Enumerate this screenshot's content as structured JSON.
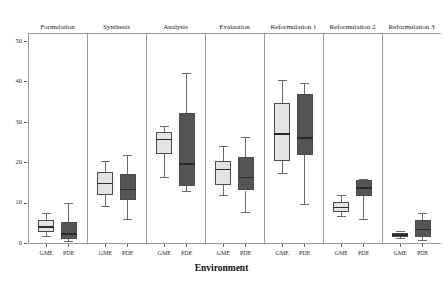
{
  "chart_data": {
    "type": "box",
    "title": "",
    "xlabel": "Environment",
    "ylabel": "",
    "ylim": [
      0,
      52
    ],
    "yticks": [
      0,
      10,
      20,
      30,
      40,
      50
    ],
    "grid": false,
    "legend": "none",
    "facet_variable": "Phase",
    "group_variable": "Environment",
    "groups": [
      "GME",
      "PDE"
    ],
    "group_colors": {
      "GME": "#e3e3e3",
      "PDE": "#555555"
    },
    "panels": [
      {
        "label": "Formulation",
        "boxes": [
          {
            "group": "GME",
            "min": 1.8,
            "q1": 2.8,
            "median": 4.0,
            "q3": 5.6,
            "max": 7.4
          },
          {
            "group": "PDE",
            "min": 0.6,
            "q1": 1.0,
            "median": 2.2,
            "q3": 5.2,
            "max": 9.8
          }
        ]
      },
      {
        "label": "Synthesis",
        "boxes": [
          {
            "group": "GME",
            "min": 9.2,
            "q1": 12.0,
            "median": 14.8,
            "q3": 17.6,
            "max": 20.4
          },
          {
            "group": "PDE",
            "min": 6.0,
            "q1": 10.6,
            "median": 13.2,
            "q3": 17.2,
            "max": 21.8
          }
        ]
      },
      {
        "label": "Analysis",
        "boxes": [
          {
            "group": "GME",
            "min": 16.4,
            "q1": 22.0,
            "median": 25.6,
            "q3": 27.4,
            "max": 29.0
          },
          {
            "group": "PDE",
            "min": 12.8,
            "q1": 14.0,
            "median": 19.6,
            "q3": 32.2,
            "max": 42.0
          }
        ]
      },
      {
        "label": "Evaluation",
        "boxes": [
          {
            "group": "GME",
            "min": 12.0,
            "q1": 14.4,
            "median": 18.2,
            "q3": 20.4,
            "max": 24.0
          },
          {
            "group": "PDE",
            "min": 7.6,
            "q1": 13.0,
            "median": 16.2,
            "q3": 21.2,
            "max": 26.2
          }
        ]
      },
      {
        "label": "Reformulation 1",
        "boxes": [
          {
            "group": "GME",
            "min": 17.4,
            "q1": 20.4,
            "median": 27.0,
            "q3": 34.6,
            "max": 40.4
          },
          {
            "group": "PDE",
            "min": 9.6,
            "q1": 21.8,
            "median": 26.0,
            "q3": 36.8,
            "max": 39.6
          }
        ]
      },
      {
        "label": "Reformulation 2",
        "boxes": [
          {
            "group": "GME",
            "min": 6.6,
            "q1": 7.6,
            "median": 8.8,
            "q3": 10.2,
            "max": 12.0
          },
          {
            "group": "PDE",
            "min": 6.0,
            "q1": 11.6,
            "median": 13.6,
            "q3": 15.6,
            "max": 15.8
          }
        ]
      },
      {
        "label": "Reformulation 3",
        "boxes": [
          {
            "group": "GME",
            "min": 1.2,
            "q1": 1.6,
            "median": 2.0,
            "q3": 2.6,
            "max": 3.0
          },
          {
            "group": "PDE",
            "min": 0.8,
            "q1": 1.4,
            "median": 3.4,
            "q3": 5.6,
            "max": 7.4
          }
        ]
      }
    ]
  }
}
